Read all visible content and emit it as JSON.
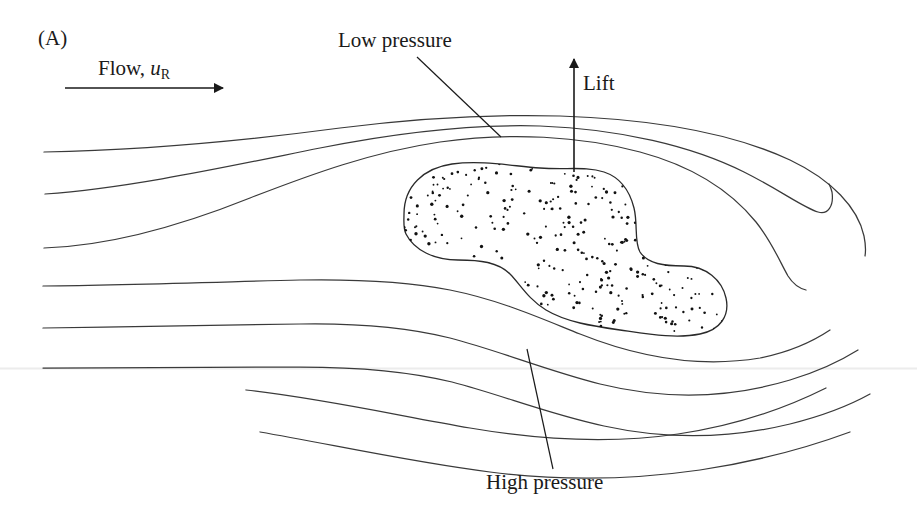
{
  "figure": {
    "panel_label": "(A)",
    "background_color": "#ffffff",
    "line_color": "#3a3a3a",
    "text_color": "#1a1a1a",
    "baseline_color": "#ececec",
    "width": 917,
    "height": 523
  },
  "labels": {
    "flow": {
      "text_prefix": "Flow, ",
      "symbol": "u",
      "subscript": "R",
      "full_text": "Flow, uR"
    },
    "low_pressure": "Low pressure",
    "lift": "Lift",
    "high_pressure": "High pressure"
  },
  "chart_data": {
    "type": "diagram",
    "annotations": [
      {
        "name": "panel-label",
        "text": "(A)",
        "x": 38,
        "y": 40
      },
      {
        "name": "flow-arrow",
        "text": "Flow, uR",
        "x": 65,
        "y": 88,
        "x2": 225,
        "direction": "right"
      },
      {
        "name": "low-pressure",
        "text": "Low pressure",
        "leader_from": [
          418,
          58
        ],
        "leader_to": [
          500,
          136
        ]
      },
      {
        "name": "lift-arrow",
        "text": "Lift",
        "from": [
          574,
          172
        ],
        "to": [
          574,
          57
        ],
        "direction": "up"
      },
      {
        "name": "high-pressure",
        "text": "High pressure",
        "leader_from": [
          552,
          470
        ],
        "leader_to": [
          527,
          350
        ]
      }
    ],
    "streamlines_count": 9,
    "body": {
      "shape": "peanut",
      "fill": "white with random black speckles",
      "speckle_count": 420,
      "bbox": [
        404,
        163,
        727,
        332
      ]
    }
  }
}
